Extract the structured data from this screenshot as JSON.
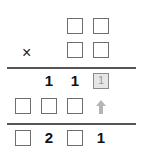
{
  "puzzle": {
    "operator": "×",
    "partial_product": [
      "1",
      "1",
      "1"
    ],
    "result_digits": [
      "2",
      "1"
    ],
    "hint_digit": "1",
    "arrow_icon": "up-arrow-icon",
    "colors": {
      "box_border": "#6e6e6e",
      "hint_fill": "#e6e6e6",
      "hint_text": "#9a9a9a",
      "arrow": "#b5b5b5",
      "text": "#111111"
    }
  }
}
